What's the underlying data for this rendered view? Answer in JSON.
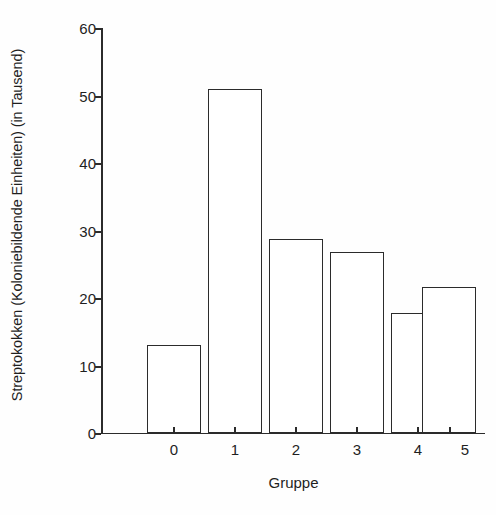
{
  "chart_data": {
    "type": "bar",
    "title": "",
    "subtitle": "",
    "categories": [
      "0",
      "1",
      "2",
      "3",
      "4",
      "5"
    ],
    "values": [
      13.0,
      51.0,
      28.7,
      26.8,
      17.8,
      21.6
    ],
    "xlabel": "Gruppe",
    "ylabel": "Streptokokken (Koloniebildende Einheiten) (in Tausend)",
    "ylim": [
      0,
      60
    ],
    "yticks": [
      0,
      10,
      20,
      30,
      40,
      50,
      60
    ],
    "ytick_labels": [
      "0",
      "10",
      "20",
      "30",
      "40",
      "50",
      "60"
    ],
    "xtick_labels": [
      "0",
      "1",
      "2",
      "3",
      "4",
      "5"
    ],
    "grid": false,
    "legend": null,
    "legend_position": "none",
    "bar_fill_color": "#ffffff",
    "bar_edge_color": "#2b2b2b",
    "axis_color": "#2b2b2b",
    "background_color": "#ffffff",
    "annotations": []
  }
}
